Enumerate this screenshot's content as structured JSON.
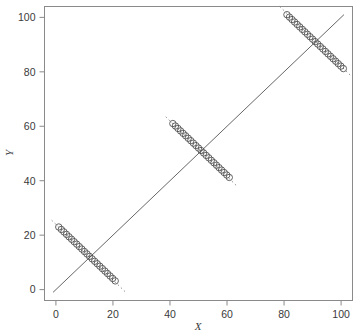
{
  "chart_data": {
    "type": "scatter",
    "title": "",
    "subtitle": "",
    "xlabel": "X",
    "ylabel": "Y",
    "xlim": [
      -4,
      104
    ],
    "ylim": [
      -4,
      104
    ],
    "xticks": [
      0,
      20,
      40,
      60,
      80,
      100
    ],
    "yticks": [
      0,
      20,
      40,
      60,
      80,
      100
    ],
    "xtick_labels": [
      "0",
      "20",
      "40",
      "60",
      "80",
      "100"
    ],
    "ytick_labels": [
      "0",
      "20",
      "40",
      "60",
      "80",
      "100"
    ],
    "grid": false,
    "legend": null,
    "marker": "open-circle",
    "marker_size": 3.2,
    "marker_color": "#4a4a4a",
    "frame_color": "#8a8a8a",
    "reference_line": {
      "name": "identity-line",
      "style": "solid",
      "color": "#555555",
      "x": [
        -1,
        101
      ],
      "y": [
        -1,
        101
      ]
    },
    "trend_lines": [
      {
        "name": "trend-low",
        "style": "dashed",
        "color": "#888888",
        "x": [
          -1.5,
          24.5
        ],
        "y": [
          25.5,
          -1.0
        ]
      },
      {
        "name": "trend-mid",
        "style": "dashed",
        "color": "#888888",
        "x": [
          38.5,
          63.5
        ],
        "y": [
          63.5,
          38.0
        ]
      },
      {
        "name": "trend-high",
        "style": "dashed",
        "color": "#888888",
        "x": [
          78.5,
          104.0
        ],
        "y": [
          104.0,
          78.0
        ]
      }
    ],
    "series": [
      {
        "name": "cluster-low",
        "points_x": [
          1.0,
          1.9,
          2.8,
          3.7,
          4.6,
          5.5,
          6.4,
          7.3,
          8.2,
          9.1,
          10.0,
          10.9,
          11.8,
          12.7,
          13.6,
          14.5,
          15.4,
          16.3,
          17.2,
          18.1,
          19.0,
          19.9,
          20.8
        ],
        "points_y": [
          23.0,
          22.1,
          21.2,
          20.3,
          19.4,
          18.5,
          17.6,
          16.7,
          15.8,
          14.9,
          14.0,
          13.1,
          12.2,
          11.3,
          10.4,
          9.5,
          8.6,
          7.7,
          6.8,
          5.9,
          5.0,
          4.1,
          3.2
        ]
      },
      {
        "name": "cluster-mid",
        "points_x": [
          41.0,
          41.9,
          42.8,
          43.7,
          44.6,
          45.5,
          46.4,
          47.3,
          48.2,
          49.1,
          50.0,
          50.9,
          51.8,
          52.7,
          53.6,
          54.5,
          55.4,
          56.3,
          57.2,
          58.1,
          59.0,
          59.9,
          60.8
        ],
        "points_y": [
          61.0,
          60.1,
          59.2,
          58.3,
          57.4,
          56.5,
          55.6,
          54.7,
          53.8,
          52.9,
          52.0,
          51.1,
          50.2,
          49.3,
          48.4,
          47.5,
          46.6,
          45.7,
          44.8,
          43.9,
          43.0,
          42.1,
          41.2
        ]
      },
      {
        "name": "cluster-high",
        "points_x": [
          81.0,
          81.9,
          82.8,
          83.7,
          84.6,
          85.5,
          86.4,
          87.3,
          88.2,
          89.1,
          90.0,
          90.9,
          91.8,
          92.7,
          93.6,
          94.5,
          95.4,
          96.3,
          97.2,
          98.1,
          99.0,
          99.9,
          100.8
        ],
        "points_y": [
          101.0,
          100.1,
          99.2,
          98.3,
          97.4,
          96.5,
          95.6,
          94.7,
          93.8,
          92.9,
          92.0,
          91.1,
          90.2,
          89.3,
          88.4,
          87.5,
          86.6,
          85.7,
          84.8,
          83.9,
          83.0,
          82.1,
          81.2
        ]
      }
    ]
  }
}
